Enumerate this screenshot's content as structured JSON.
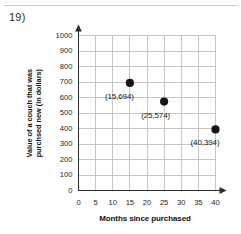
{
  "worksheet": {
    "problem_number": "19)"
  },
  "chart_data": {
    "type": "scatter",
    "title": "",
    "xlabel": "Months since purchased",
    "ylabel_lines": [
      "Value of a couch that was",
      "purchsed new (in dollars)"
    ],
    "ylabel": "Value of a couch that was purchsed new (in dollars)",
    "xlim": [
      0,
      40
    ],
    "ylim": [
      0,
      1000
    ],
    "xticks": [
      0,
      5,
      10,
      15,
      20,
      25,
      30,
      35,
      40
    ],
    "xtick_labels": [
      "0",
      "5",
      "10",
      "15",
      "20",
      "25",
      "30",
      "35",
      "40"
    ],
    "yticks": [
      0,
      100,
      200,
      300,
      400,
      500,
      600,
      700,
      800,
      900,
      1000
    ],
    "ytick_labels": [
      "0",
      "100",
      "200",
      "300",
      "400",
      "500",
      "600",
      "700",
      "800",
      "900",
      "1000"
    ],
    "grid": true,
    "legend": false,
    "x": [
      15,
      25,
      40
    ],
    "y": [
      694,
      574,
      394
    ],
    "point_labels": [
      "(15,694)",
      "(25,574)",
      "(40,394)"
    ],
    "marker_color": "#151515",
    "grid_color": "#c6c6c6",
    "axis_color": "#2b2b2b"
  }
}
